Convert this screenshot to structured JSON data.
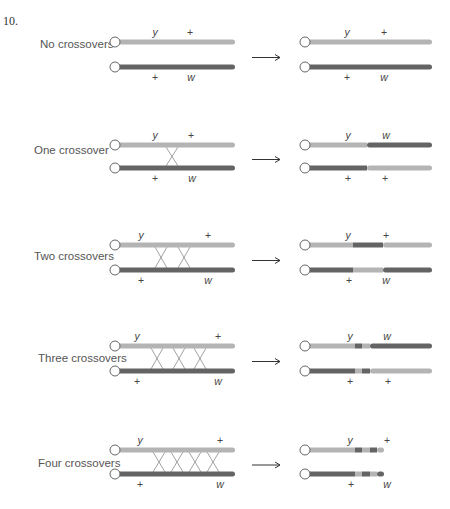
{
  "problem_number": "10.",
  "colors": {
    "light_chromatid": "#b4b4b4",
    "dark_chromatid": "#646464",
    "crossover_line": "#8a8a8a",
    "centromere_fill": "#ffffff",
    "centromere_stroke": "#666666",
    "arrow": "#333333",
    "text": "#555555"
  },
  "rows": [
    {
      "label": "No crossovers",
      "crossovers": 0,
      "parental": {
        "top": {
          "color": "light",
          "genes": [
            {
              "symbol": "y",
              "italic": true,
              "x": 155
            },
            {
              "symbol": "+",
              "italic": false,
              "x": 190
            }
          ]
        },
        "bottom": {
          "color": "dark",
          "genes": [
            {
              "symbol": "+",
              "italic": false,
              "x": 155
            },
            {
              "symbol": "w",
              "italic": true,
              "x": 191
            }
          ]
        }
      },
      "result": {
        "top": {
          "segments": [
            "light"
          ],
          "genes": [
            {
              "symbol": "y",
              "italic": true,
              "x": 347
            },
            {
              "symbol": "+",
              "italic": false,
              "x": 384
            }
          ]
        },
        "bottom": {
          "segments": [
            "dark"
          ],
          "genes": [
            {
              "symbol": "+",
              "italic": false,
              "x": 347
            },
            {
              "symbol": "w",
              "italic": true,
              "x": 384
            }
          ]
        }
      }
    },
    {
      "label": "One crossover",
      "crossovers": 1,
      "parental": {
        "top": {
          "color": "light",
          "genes": [
            {
              "symbol": "y",
              "italic": true,
              "x": 155
            },
            {
              "symbol": "+",
              "italic": false,
              "x": 191
            }
          ]
        },
        "bottom": {
          "color": "dark",
          "genes": [
            {
              "symbol": "+",
              "italic": false,
              "x": 155
            },
            {
              "symbol": "w",
              "italic": true,
              "x": 192
            }
          ]
        }
      },
      "result": {
        "top": {
          "segments": [
            "light",
            "dark"
          ],
          "genes": [
            {
              "symbol": "y",
              "italic": true,
              "x": 348
            },
            {
              "symbol": "w",
              "italic": true,
              "x": 386
            }
          ]
        },
        "bottom": {
          "segments": [
            "dark",
            "light"
          ],
          "genes": [
            {
              "symbol": "+",
              "italic": false,
              "x": 348
            },
            {
              "symbol": "+",
              "italic": false,
              "x": 385
            }
          ]
        }
      }
    },
    {
      "label": "Two crossovers",
      "crossovers": 2,
      "parental": {
        "top": {
          "color": "light",
          "genes": [
            {
              "symbol": "y",
              "italic": true,
              "x": 141
            },
            {
              "symbol": "+",
              "italic": false,
              "x": 208
            }
          ]
        },
        "bottom": {
          "color": "dark",
          "genes": [
            {
              "symbol": "+",
              "italic": false,
              "x": 141
            },
            {
              "symbol": "w",
              "italic": true,
              "x": 208
            }
          ]
        }
      },
      "result": {
        "top": {
          "segments": [
            "light",
            "dark",
            "light"
          ],
          "genes": [
            {
              "symbol": "y",
              "italic": true,
              "x": 348
            },
            {
              "symbol": "+",
              "italic": false,
              "x": 386
            }
          ]
        },
        "bottom": {
          "segments": [
            "dark",
            "light",
            "dark"
          ],
          "genes": [
            {
              "symbol": "+",
              "italic": false,
              "x": 349
            },
            {
              "symbol": "w",
              "italic": true,
              "x": 386
            }
          ]
        }
      }
    },
    {
      "label": "Three crossovers",
      "crossovers": 3,
      "parental": {
        "top": {
          "color": "light",
          "genes": [
            {
              "symbol": "y",
              "italic": true,
              "x": 137
            },
            {
              "symbol": "+",
              "italic": false,
              "x": 218
            }
          ]
        },
        "bottom": {
          "color": "dark",
          "genes": [
            {
              "symbol": "+",
              "italic": false,
              "x": 137
            },
            {
              "symbol": "w",
              "italic": true,
              "x": 218
            }
          ]
        }
      },
      "result": {
        "top": {
          "segments": [
            "light",
            "dark",
            "light",
            "dark"
          ],
          "genes": [
            {
              "symbol": "y",
              "italic": true,
              "x": 350
            },
            {
              "symbol": "w",
              "italic": true,
              "x": 387
            }
          ]
        },
        "bottom": {
          "segments": [
            "dark",
            "light",
            "dark",
            "light"
          ],
          "genes": [
            {
              "symbol": "+",
              "italic": false,
              "x": 350
            },
            {
              "symbol": "+",
              "italic": false,
              "x": 388
            }
          ]
        }
      }
    },
    {
      "label": "Four crossovers",
      "crossovers": 4,
      "parental": {
        "top": {
          "color": "light",
          "genes": [
            {
              "symbol": "y",
              "italic": true,
              "x": 140
            },
            {
              "symbol": "+",
              "italic": false,
              "x": 220
            }
          ]
        },
        "bottom": {
          "color": "dark",
          "genes": [
            {
              "symbol": "+",
              "italic": false,
              "x": 140
            },
            {
              "symbol": "w",
              "italic": true,
              "x": 220
            }
          ]
        }
      },
      "result": {
        "top": {
          "segments": [
            "light",
            "dark",
            "light",
            "dark",
            "light"
          ],
          "genes": [
            {
              "symbol": "y",
              "italic": true,
              "x": 350
            },
            {
              "symbol": "+",
              "italic": false,
              "x": 387
            }
          ]
        },
        "bottom": {
          "segments": [
            "dark",
            "light",
            "dark",
            "light",
            "dark"
          ],
          "genes": [
            {
              "symbol": "+",
              "italic": false,
              "x": 351
            },
            {
              "symbol": "w",
              "italic": true,
              "x": 387
            }
          ]
        }
      }
    }
  ],
  "arrow_icon": "right-arrow"
}
